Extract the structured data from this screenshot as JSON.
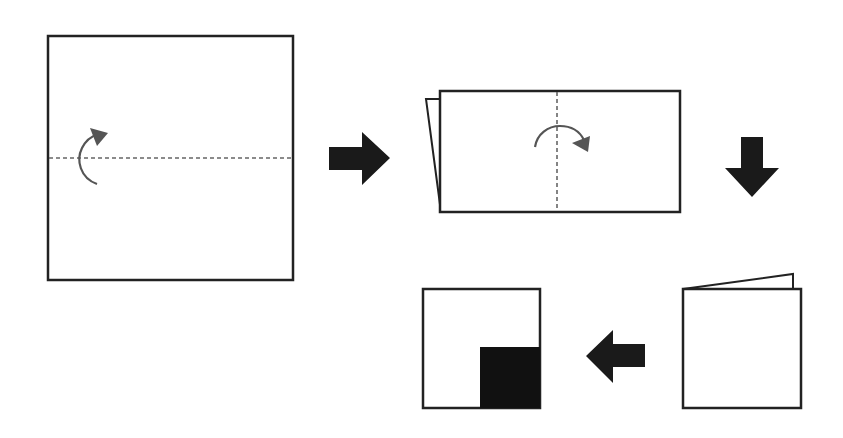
{
  "diagram": {
    "type": "paper-folding-sequence",
    "colors": {
      "background": "#ffffff",
      "outline": "#222222",
      "fold_line": "#666666",
      "fold_arrow": "#555555",
      "step_arrow": "#1a1a1a",
      "shaded_region": "#111111"
    },
    "steps": [
      {
        "index": 1,
        "shape": "square",
        "fold_line": "horizontal-dashed",
        "fold_direction": "bottom-up"
      },
      {
        "index": 2,
        "shape": "rectangle-folded",
        "fold_line": "vertical-dashed",
        "fold_direction": "left-to-right"
      },
      {
        "index": 3,
        "shape": "square-folded-twice"
      },
      {
        "index": 4,
        "shape": "square-result",
        "shaded": "bottom-right-quadrant"
      }
    ],
    "transitions": [
      {
        "from": 1,
        "to": 2,
        "direction": "right"
      },
      {
        "from": 2,
        "to": 3,
        "direction": "down"
      },
      {
        "from": 3,
        "to": 4,
        "direction": "left"
      }
    ]
  }
}
